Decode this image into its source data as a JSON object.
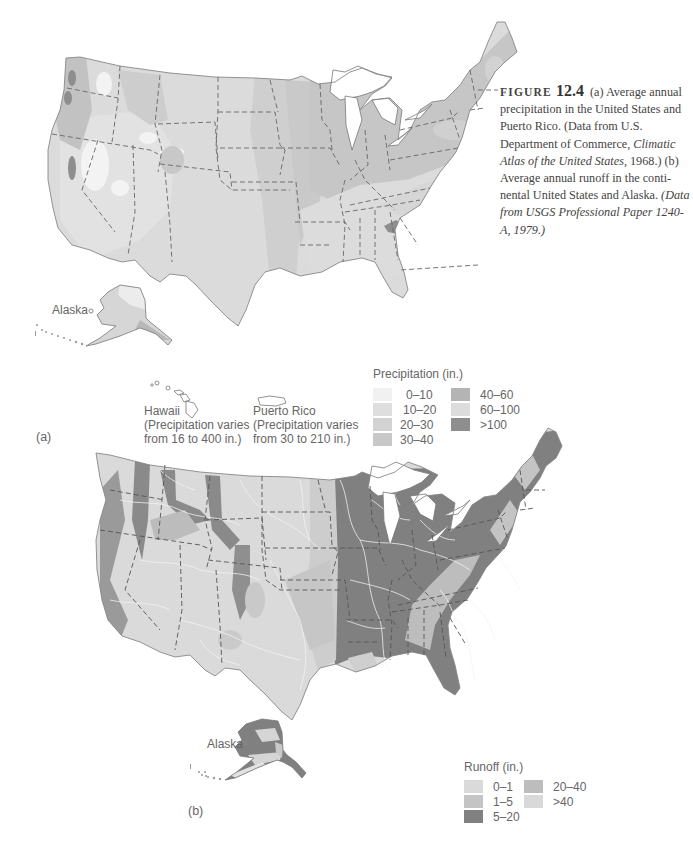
{
  "caption": {
    "figure_word": "FIGURE",
    "figure_number": "12.4",
    "part_a": "(a) Average annual precipitation in the United States and Puerto Rico. (Data from U.S. Department of Commerce,",
    "part_a_italic": "Climatic Atlas of the United States,",
    "part_a_end": "1968.) (b) Average annual runoff in the conti-nental United States and Alaska.",
    "part_b_italic": "(Data from USGS Professional Paper 1240-A, 1979.)"
  },
  "map_a": {
    "panel_label": "(a)",
    "alaska_label": "Alaska",
    "hawaii": {
      "name": "Hawaii",
      "note_line1": "(Precipitation varies",
      "note_line2": "from 16 to 400 in.)"
    },
    "puerto_rico": {
      "name": "Puerto Rico",
      "note_line1": "(Precipitation varies",
      "note_line2": "from 30 to 210 in.)"
    },
    "legend": {
      "title": "Precipitation (in.)",
      "items": [
        {
          "label": "0–10",
          "color": "#f1f1f1"
        },
        {
          "label": "10–20",
          "color": "#dedede"
        },
        {
          "label": "20–30",
          "color": "#d2d2d2"
        },
        {
          "label": "30–40",
          "color": "#c8c8c8"
        },
        {
          "label": "40–60",
          "color": "#b4b4b4"
        },
        {
          "label": "60–100",
          "color": "#dcdcdc"
        },
        {
          "label": ">100",
          "color": "#8e8e8e"
        }
      ]
    }
  },
  "map_b": {
    "panel_label": "(b)",
    "alaska_label": "Alaska",
    "legend": {
      "title": "Runoff (in.)",
      "items": [
        {
          "label": "0–1",
          "color": "#dadada"
        },
        {
          "label": "1–5",
          "color": "#c4c4c4"
        },
        {
          "label": "5–20",
          "color": "#808080"
        },
        {
          "label": "20–40",
          "color": "#bdbdbd"
        },
        {
          "label": ">40",
          "color": "#d9d9d9"
        }
      ]
    }
  }
}
